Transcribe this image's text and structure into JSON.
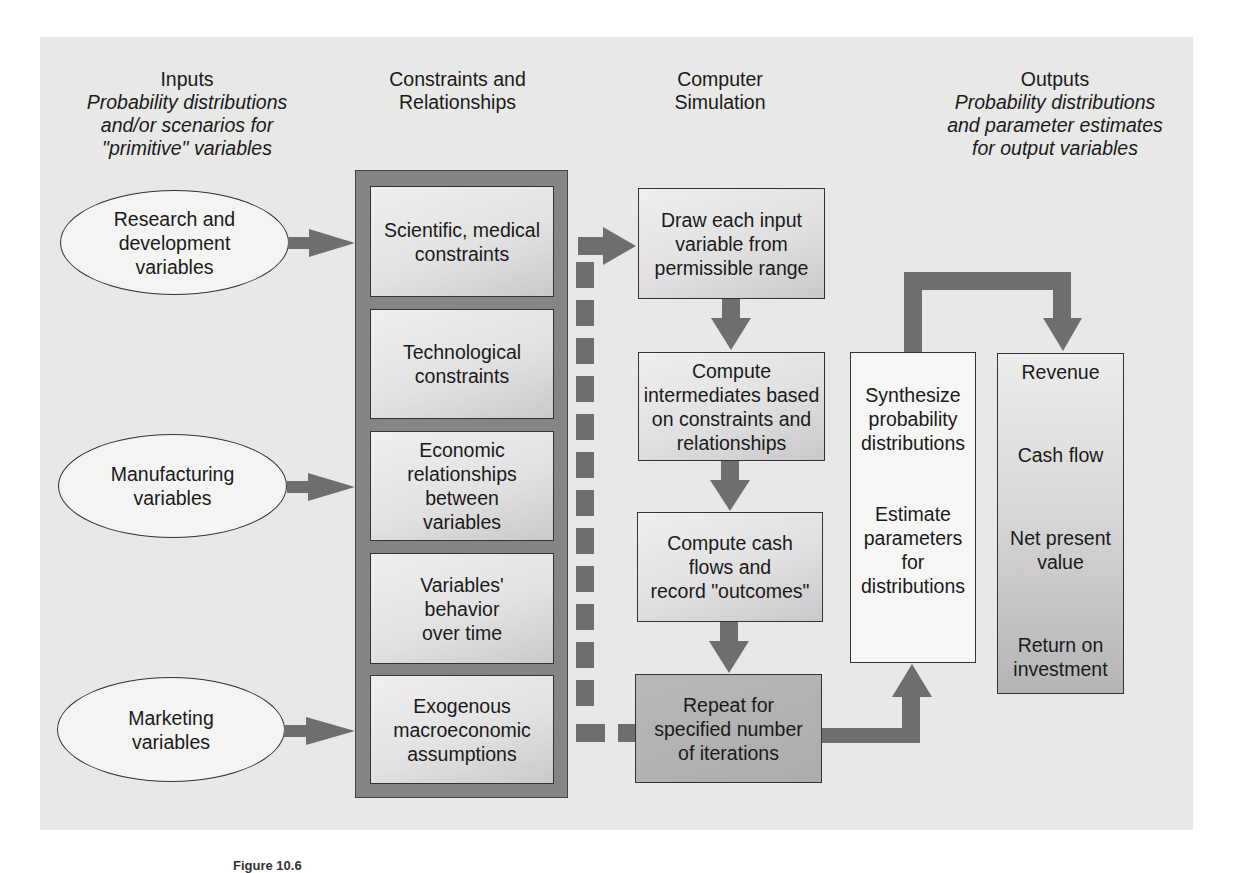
{
  "headers": {
    "inputs": {
      "title": "Inputs",
      "subtitle_lines": [
        "Probability distributions",
        "and/or scenarios for",
        "\"primitive\" variables"
      ]
    },
    "constraints": {
      "title_lines": [
        "Constraints and",
        "Relationships"
      ]
    },
    "simulation": {
      "title_lines": [
        "Computer",
        "Simulation"
      ]
    },
    "outputs": {
      "title": "Outputs",
      "subtitle_lines": [
        "Probability distributions",
        "and parameter estimates",
        "for output variables"
      ]
    }
  },
  "inputs": [
    {
      "lines": [
        "Research and",
        "development",
        "variables"
      ]
    },
    {
      "lines": [
        "Manufacturing",
        "variables"
      ]
    },
    {
      "lines": [
        "Marketing",
        "variables"
      ]
    }
  ],
  "constraints": [
    {
      "lines": [
        "Scientific, medical",
        "constraints"
      ]
    },
    {
      "lines": [
        "Technological",
        "constraints"
      ]
    },
    {
      "lines": [
        "Economic",
        "relationships",
        "between",
        "variables"
      ]
    },
    {
      "lines": [
        "Variables'",
        "behavior",
        "over time"
      ]
    },
    {
      "lines": [
        "Exogenous",
        "macroeconomic",
        "assumptions"
      ]
    }
  ],
  "simulation_steps": [
    {
      "lines": [
        "Draw each input",
        "variable from",
        "permissible range"
      ]
    },
    {
      "lines": [
        "Compute",
        "intermediates based",
        "on constraints and",
        "relationships"
      ]
    },
    {
      "lines": [
        "Compute cash",
        "flows and",
        "record \"outcomes\""
      ]
    },
    {
      "lines": [
        "Repeat for",
        "specified number",
        "of iterations"
      ]
    }
  ],
  "synthesis": {
    "block1": [
      "Synthesize",
      "probability",
      "distributions"
    ],
    "block2": [
      "Estimate",
      "parameters",
      "for",
      "distributions"
    ]
  },
  "outputs": [
    {
      "lines": [
        "Revenue"
      ]
    },
    {
      "lines": [
        "Cash flow"
      ]
    },
    {
      "lines": [
        "Net present",
        "value"
      ]
    },
    {
      "lines": [
        "Return on",
        "investment"
      ]
    }
  ],
  "caption": "Figure 10.6",
  "colors": {
    "panel": "#e8e8e6",
    "frame": "#858585",
    "arrow": "#6e6e6e",
    "border": "#333333"
  }
}
